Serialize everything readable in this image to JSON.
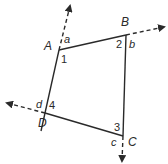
{
  "diagram": {
    "title": "",
    "shape": "quadrilateral",
    "stroke_color": "#2a2a2a",
    "vertices": [
      {
        "name": "A",
        "x": 59,
        "y": 50
      },
      {
        "name": "B",
        "x": 126,
        "y": 35
      },
      {
        "name": "C",
        "x": 123,
        "y": 136
      },
      {
        "name": "D",
        "x": 45,
        "y": 113
      }
    ],
    "labels": {
      "A": "A",
      "B": "B",
      "C": "C",
      "D": "D",
      "interior": {
        "one": "1",
        "two": "2",
        "three": "3",
        "four": "4"
      },
      "exterior": {
        "a": "a",
        "b": "b",
        "c": "c",
        "d": "d"
      }
    },
    "extensions": [
      {
        "from": "D",
        "through": "A",
        "style": "dashed-arrow"
      },
      {
        "from": "A",
        "through": "B",
        "style": "dashed-arrow"
      },
      {
        "from": "B",
        "through": "C",
        "style": "dashed-arrow"
      },
      {
        "from": "C",
        "through": "D",
        "style": "dashed-arrow"
      }
    ]
  }
}
